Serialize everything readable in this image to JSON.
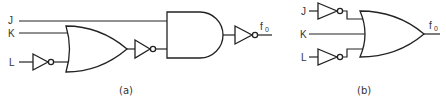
{
  "diagram": {
    "type": "logic-circuit-comparison",
    "circuits": [
      {
        "id": "a",
        "caption": "(a)",
        "inputs": [
          "J",
          "K",
          "L"
        ],
        "output": {
          "label": "f",
          "subscript": "0"
        },
        "gates": [
          {
            "type": "NOT",
            "input": "L"
          },
          {
            "type": "OR",
            "inputs": [
              "K",
              "NOT L"
            ]
          },
          {
            "type": "NOT",
            "input": "OR"
          },
          {
            "type": "AND",
            "inputs": [
              "J",
              "NOT OR"
            ]
          },
          {
            "type": "NOT",
            "input": "AND",
            "output": "f0"
          }
        ]
      },
      {
        "id": "b",
        "caption": "(b)",
        "inputs": [
          "J",
          "K",
          "L"
        ],
        "output": {
          "label": "f",
          "subscript": "0"
        },
        "gates": [
          {
            "type": "NOT",
            "input": "J"
          },
          {
            "type": "NOT",
            "input": "L"
          },
          {
            "type": "OR",
            "inputs": [
              "NOT J",
              "K",
              "NOT L"
            ],
            "output": "f0"
          }
        ]
      }
    ]
  },
  "labels": {
    "a_J": "J",
    "a_K": "K",
    "a_L": "L",
    "a_out": "f",
    "a_out_sub": "0",
    "a_caption": "(a)",
    "b_J": "J",
    "b_K": "K",
    "b_L": "L",
    "b_out": "f",
    "b_out_sub": "0",
    "b_caption": "(b)"
  },
  "colors": {
    "line": "#222222",
    "text": "#333333",
    "background": "#ffffff"
  }
}
